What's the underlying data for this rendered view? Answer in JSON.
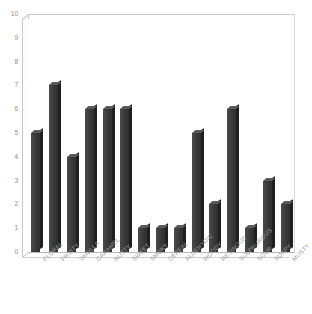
{
  "chart_data": {
    "type": "bar",
    "title": "",
    "subtitle": "",
    "xlabel": "",
    "ylabel": "",
    "ylim": [
      0,
      10
    ],
    "ytick_step": 1,
    "yticks": [
      0,
      1,
      2,
      3,
      4,
      5,
      6,
      7,
      8,
      9,
      10
    ],
    "grid": false,
    "legend": false,
    "legend_position": "none",
    "categories": [
      "FLORAL",
      "FRUITY",
      "VANILLA",
      "CARAMEL",
      "NUTTY",
      "SWEET",
      "SMOKY",
      "CEREAL",
      "ALDEHYDIC",
      "WOODY",
      "RESINOUS",
      "SULPHUROUS",
      "SOUR",
      "SOAPY",
      "MUSTY"
    ],
    "values": [
      5,
      7,
      4,
      6,
      6,
      6,
      1,
      1,
      1,
      5,
      2,
      6,
      1,
      3,
      2
    ],
    "bar_color": "#3d3d3d",
    "axis_color": "#c9c9c9",
    "tick_label_color": "#8e8e8e",
    "background_color": "#ffffff"
  }
}
